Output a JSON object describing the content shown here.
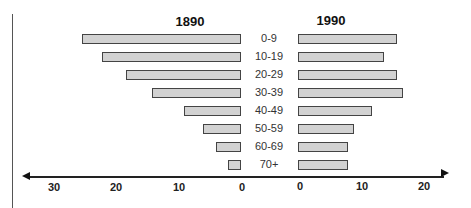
{
  "chart_data": {
    "type": "bar",
    "subtype": "population-pyramid",
    "title": "",
    "categories": [
      "0-9",
      "10-19",
      "20-29",
      "30-39",
      "40-49",
      "50-59",
      "60-69",
      "70+"
    ],
    "series": [
      {
        "name": "1890",
        "side": "left",
        "values": [
          25.5,
          22.3,
          18.4,
          14.3,
          9.2,
          6.1,
          4.0,
          2.0
        ]
      },
      {
        "name": "1990",
        "side": "right",
        "values": [
          16,
          13.8,
          16,
          17,
          12,
          9,
          8,
          8
        ]
      }
    ],
    "left_axis": {
      "ticks": [
        "30",
        "20",
        "10",
        "0"
      ],
      "range": [
        30,
        0
      ]
    },
    "right_axis": {
      "ticks": [
        "0",
        "10",
        "20"
      ],
      "range": [
        0,
        20
      ]
    },
    "xlabel": "",
    "ylabel": "",
    "grid": false,
    "legend": "titles above each side"
  },
  "titles": {
    "left": "1890",
    "right": "1990"
  },
  "ticks": {
    "left": [
      {
        "label": "30",
        "x": 54
      },
      {
        "label": "20",
        "x": 116
      },
      {
        "label": "10",
        "x": 179
      },
      {
        "label": "0",
        "x": 242
      }
    ],
    "right": [
      {
        "label": "0",
        "x": 300
      },
      {
        "label": "10",
        "x": 362
      },
      {
        "label": "20",
        "x": 424
      }
    ]
  },
  "colors": {
    "bar_fill": "#d2d2d2",
    "bar_border": "#444444",
    "axis": "#222222"
  }
}
